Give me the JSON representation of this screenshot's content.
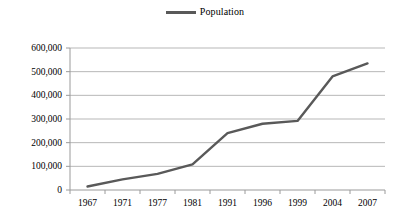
{
  "legend": {
    "position": "top-center",
    "entries": [
      {
        "label": "Population",
        "color": "#595959",
        "marker": "line"
      }
    ]
  },
  "colors": {
    "series_line": "#595959",
    "gridline": "#b7b7b7",
    "axis": "#9a9a9a",
    "background": "#ffffff",
    "text": "#000000"
  },
  "chart_data": {
    "type": "line",
    "title": "",
    "subtitle": "",
    "xlabel": "",
    "ylabel": "",
    "categories": [
      "1967",
      "1971",
      "1977",
      "1981",
      "1991",
      "1996",
      "1999",
      "2004",
      "2007"
    ],
    "series": [
      {
        "name": "Population",
        "color": "#595959",
        "values": [
          15000,
          45000,
          68000,
          108000,
          240000,
          280000,
          292000,
          480000,
          535000
        ]
      }
    ],
    "ylim": [
      0,
      600000
    ],
    "yticks": [
      0,
      100000,
      200000,
      300000,
      400000,
      500000,
      600000
    ],
    "ytick_labels": [
      "0",
      "100,000",
      "200,000",
      "300,000",
      "400,000",
      "500,000",
      "600,000"
    ],
    "grid": true,
    "grid_axis": "y",
    "legend_position": "top-center"
  }
}
